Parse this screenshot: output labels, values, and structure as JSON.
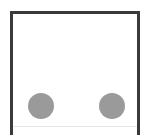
{
  "figure": {
    "type": "schematic-diagram",
    "background_color": "#ffffff",
    "frame": {
      "name": "outer-frame",
      "stroke_color": "#3a3a3a",
      "stroke_width_px": 3,
      "fill_color": "#ffffff",
      "left_px": 10,
      "top_px": 11,
      "width_px": 130,
      "height_px": 124,
      "open_edge": "bottom",
      "bottom_hairline_color": "#e8e8e8"
    },
    "shapes": [
      {
        "name": "circle-left",
        "shape": "circle",
        "fill_color": "#9a9a9a",
        "center_x_px": 41,
        "center_y_px": 106,
        "diameter_px": 26
      },
      {
        "name": "circle-right",
        "shape": "circle",
        "fill_color": "#9a9a9a",
        "center_x_px": 112,
        "center_y_px": 106,
        "diameter_px": 26
      }
    ],
    "labels": []
  }
}
